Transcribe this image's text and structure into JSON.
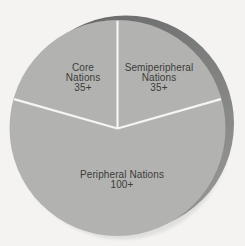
{
  "figure": {
    "background_color": "#f4f3f1"
  },
  "chart_data": {
    "type": "pie",
    "title": "",
    "legend": "none",
    "labels_position": "inside",
    "start_angle_deg": 90,
    "direction": "clockwise",
    "segments": [
      {
        "name": "Semiperipheral Nations",
        "value": 35,
        "value_label": "35+",
        "label_lines": [
          "Semiperipheral",
          "Nations",
          "35+"
        ]
      },
      {
        "name": "Peripheral Nations",
        "value": 100,
        "value_label": "100+",
        "label_lines": [
          "Peripheral Nations",
          "100+"
        ]
      },
      {
        "name": "Core Nations",
        "value": 35,
        "value_label": "35+",
        "label_lines": [
          "Core",
          "Nations",
          "35+"
        ]
      }
    ],
    "colors": {
      "slice_fill": "#b2b3b1",
      "depth_rim_dark": "#666867",
      "depth_rim_light": "#949593",
      "divider_line": "#f5f5f3",
      "label_text": "#3c3c3a",
      "outer_shadow": "#cfcfcd"
    }
  }
}
